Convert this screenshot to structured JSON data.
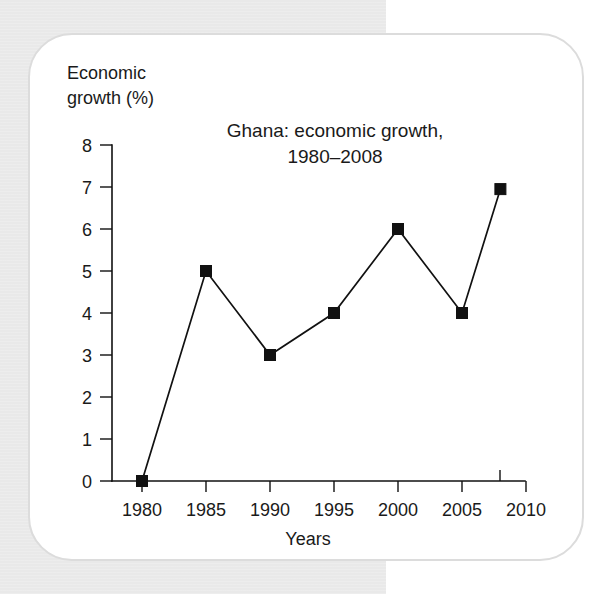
{
  "figure": {
    "y_axis_caption": "Economic\ngrowth (%)",
    "x_axis_caption": "Years",
    "title_line1": "Ghana: economic growth,",
    "title_line2": "1980–2008",
    "title_full": "Ghana: economic growth, 1980–2008",
    "colors": {
      "ink": "#111111",
      "card_background": "#ffffff",
      "card_border": "#dcdcdc",
      "page_background": "#e9e9e9",
      "marker": "#111111"
    }
  },
  "chart_data": {
    "type": "line",
    "title": "Ghana: economic growth, 1980–2008",
    "xlabel": "Years",
    "ylabel": "Economic growth (%)",
    "x": [
      1980,
      1985,
      1990,
      1995,
      2000,
      2005,
      2008
    ],
    "values": [
      0,
      5,
      3,
      4,
      6,
      4,
      6.95
    ],
    "series": [
      {
        "name": "Economic growth (%)",
        "x": [
          1980,
          1985,
          1990,
          1995,
          2000,
          2005,
          2008
        ],
        "values": [
          0,
          5,
          3,
          4,
          6,
          4,
          6.95
        ]
      }
    ],
    "xlim": [
      1978,
      2012
    ],
    "ylim": [
      0,
      8
    ],
    "xticks": [
      1980,
      1985,
      1990,
      1995,
      2000,
      2005,
      2010
    ],
    "xtick_labels": [
      "1980",
      "1985",
      "1990",
      "1995",
      "2000",
      "2005",
      "2010"
    ],
    "yticks": [
      0,
      1,
      2,
      3,
      4,
      5,
      6,
      7,
      8
    ],
    "ytick_labels": [
      "0",
      "1",
      "2",
      "3",
      "4",
      "5",
      "6",
      "7",
      "8"
    ],
    "grid": false,
    "legend": null,
    "marker": "square"
  }
}
